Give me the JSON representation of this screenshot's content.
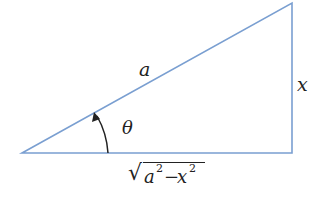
{
  "diagram": {
    "type": "right-triangle",
    "line_color": "#7a9fd1",
    "labels": {
      "hypotenuse": "a",
      "opposite": "x",
      "angle": "θ",
      "adjacent_radicand_a": "a",
      "adjacent_radicand_x": "x",
      "exp": "2",
      "minus": "−",
      "sqrt": "√"
    }
  }
}
